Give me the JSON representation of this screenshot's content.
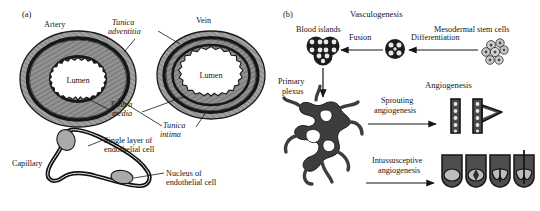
{
  "figure": {
    "panels": [
      {
        "id": "a",
        "label": "(a)",
        "title": "Blood vessel wall structure",
        "labels": {
          "artery": "Artery",
          "vein": "Vein",
          "lumen_artery": "Lumen",
          "lumen_vein": "Lumen",
          "tunica_adventitia": "Tunica\nadventitia",
          "tunica_adventitia_l1": "Tunica",
          "tunica_adventitia_l2": "adventitia",
          "tunica_media_l1": "Tunica",
          "tunica_media_l2": "media",
          "tunica_intima_l1": "Tunica",
          "tunica_intima_l2": "intima",
          "capillary": "Capillary",
          "single_layer_l1": "Single layer of",
          "single_layer_l2": "endothelial cell",
          "nucleus_l1": "Nucleus of",
          "nucleus_l2": "endothelial cell"
        }
      },
      {
        "id": "b",
        "label": "(b)",
        "title": "Vasculogenesis and angiogenesis",
        "labels": {
          "vasculogenesis": "Vasculogenesis",
          "angiogenesis": "Angiogenesis",
          "blood_islands": "Blood islands",
          "fusion": "Fusion",
          "differentiation": "Differentiation",
          "mesodermal_stem_cells": "Mesodermal stem cells",
          "primary_plexus_l1": "Primary",
          "primary_plexus_l2": "plexus",
          "sprouting_l1": "Sprouting",
          "sprouting_l2": "angiogenesis",
          "intussusceptive_l1": "Intussusceptive",
          "intussusceptive_l2": "angiogenesis"
        }
      }
    ]
  },
  "colors": {
    "ink": "#151515",
    "outline": "#000000",
    "wall_dark": "#4a4a4a",
    "wall_mid": "#6e6e6e",
    "wall_light": "#9a9a9a",
    "wall_pale": "#c2c2c2",
    "lumen": "#ffffff",
    "nucleus": "#a8a8a8",
    "background": "#ffffff"
  }
}
